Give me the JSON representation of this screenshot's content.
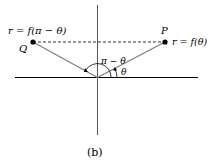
{
  "diagram": {
    "caption": "(b)",
    "point_q": {
      "name": "Q",
      "equation": "r = f(π − θ)"
    },
    "point_p": {
      "name": "P",
      "equation": "r = f(θ)"
    },
    "angle_outer": "π − θ",
    "angle_inner": "θ",
    "colors": {
      "axis": "#000000",
      "ray": "#808080",
      "dashed": "#000000",
      "point": "#000000"
    }
  }
}
